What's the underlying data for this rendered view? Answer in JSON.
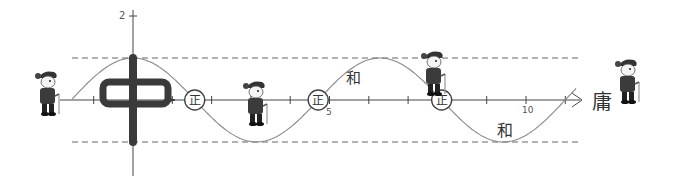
{
  "diagram": {
    "function": "y = cos(x)",
    "axes": {
      "origin_px": [
        133,
        100
      ],
      "unit_x_px": 39.3,
      "unit_y_px": 42,
      "y_tick_label": "2",
      "x_tick_labels": [
        {
          "value": 5,
          "text": "5"
        },
        {
          "value": 10,
          "text": "10"
        }
      ],
      "x_ticks": [
        -1,
        1,
        2,
        3,
        4,
        5,
        6,
        7,
        8,
        9,
        10,
        11
      ]
    },
    "bounds": {
      "upper": 1,
      "lower": -1
    },
    "characters": {
      "center": "中",
      "zero_marker": "正",
      "near_peak": "和",
      "near_trough": "和",
      "axis_end": "庸"
    },
    "colors": {
      "curve": "#888888",
      "axis": "#444444",
      "dashed": "#666666",
      "ink": "#333333"
    },
    "figures": [
      {
        "name": "figure-left",
        "x": 48,
        "y": 100
      },
      {
        "name": "figure-trough",
        "x": 256,
        "y": 110
      },
      {
        "name": "figure-peak-right",
        "x": 434,
        "y": 80
      },
      {
        "name": "figure-far-right",
        "x": 628,
        "y": 88
      }
    ]
  }
}
